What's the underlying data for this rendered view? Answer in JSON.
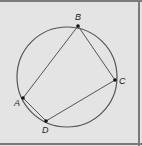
{
  "diagram": {
    "type": "inscribed-quadrilateral",
    "circle": {
      "cx": 67,
      "cy": 77,
      "r": 50
    },
    "points": [
      {
        "id": "A",
        "label": "A",
        "x": 23,
        "y": 98,
        "lx": 14,
        "ly": 106
      },
      {
        "id": "B",
        "label": "B",
        "x": 78,
        "y": 26,
        "lx": 75,
        "ly": 20
      },
      {
        "id": "C",
        "label": "C",
        "x": 115,
        "y": 80,
        "lx": 119,
        "ly": 84
      },
      {
        "id": "D",
        "label": "D",
        "x": 46,
        "y": 121,
        "lx": 42,
        "ly": 133
      }
    ],
    "segments": [
      [
        "A",
        "B"
      ],
      [
        "B",
        "C"
      ],
      [
        "C",
        "D"
      ],
      [
        "D",
        "A"
      ]
    ],
    "colors": {
      "background": "#e4e4e4",
      "stroke": "#555555",
      "border": "#7a7a7a"
    }
  }
}
